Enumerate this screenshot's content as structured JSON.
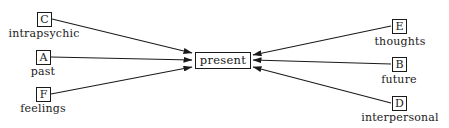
{
  "diagram": {
    "center": {
      "label": "present"
    },
    "nodes": [
      {
        "id": "C",
        "label": "intrapsychic",
        "side": "left"
      },
      {
        "id": "A",
        "label": "past",
        "side": "left"
      },
      {
        "id": "F",
        "label": "feelings",
        "side": "left"
      },
      {
        "id": "E",
        "label": "thoughts",
        "side": "right"
      },
      {
        "id": "B",
        "label": "future",
        "side": "right"
      },
      {
        "id": "D",
        "label": "interpersonal",
        "side": "right"
      }
    ],
    "edges": [
      {
        "from": "C",
        "to": "present",
        "arrow": "to"
      },
      {
        "from": "A",
        "to": "present",
        "arrow": "to"
      },
      {
        "from": "F",
        "to": "present",
        "arrow": "to"
      },
      {
        "from": "E",
        "to": "present",
        "arrow": "to"
      },
      {
        "from": "B",
        "to": "present",
        "arrow": "to"
      },
      {
        "from": "D",
        "to": "present",
        "arrow": "to"
      }
    ]
  }
}
